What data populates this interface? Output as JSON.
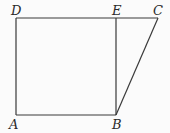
{
  "diagram": {
    "stroke_color": "#3a3a3a",
    "points": {
      "A": {
        "label": "A",
        "x": 16,
        "y": 115,
        "lx": 9,
        "ly": 129
      },
      "B": {
        "label": "B",
        "x": 116,
        "y": 115,
        "lx": 112,
        "ly": 129
      },
      "C": {
        "label": "C",
        "x": 158,
        "y": 18,
        "lx": 153,
        "ly": 15
      },
      "D": {
        "label": "D",
        "x": 16,
        "y": 18,
        "lx": 11,
        "ly": 15
      },
      "E": {
        "label": "E",
        "x": 116,
        "y": 18,
        "lx": 112,
        "ly": 15
      }
    },
    "segments": [
      [
        "A",
        "B"
      ],
      [
        "A",
        "D"
      ],
      [
        "D",
        "C"
      ],
      [
        "E",
        "B"
      ],
      [
        "B",
        "C"
      ]
    ]
  }
}
